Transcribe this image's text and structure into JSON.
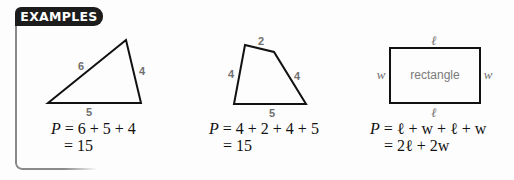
{
  "header": {
    "badge": "EXAMPLES"
  },
  "examples": [
    {
      "shape": "triangle",
      "side_labels": [
        "6",
        "4",
        "5"
      ],
      "formula_line1_var": "P",
      "formula_line1": " = 6 + 5 + 4",
      "formula_line2": "= 15"
    },
    {
      "shape": "quadrilateral",
      "side_labels": [
        "2",
        "4",
        "4",
        "5"
      ],
      "formula_line1_var": "P",
      "formula_line1": " = 4 + 2 + 4 + 5",
      "formula_line2": "= 15"
    },
    {
      "shape": "rectangle",
      "center_text": "rectangle",
      "side_labels": {
        "top": "ℓ",
        "bottom": "ℓ",
        "left": "w",
        "right": "w"
      },
      "formula_line1_var": "P",
      "formula_line1": " = ℓ + w + ℓ + w",
      "formula_line2": "= 2ℓ + 2w"
    }
  ],
  "colors": {
    "badge_bg": "#1c1c1c",
    "badge_text": "#ffffff",
    "frame": "#8a8a8a",
    "label": "#6f6f6f",
    "stroke": "#111111"
  }
}
